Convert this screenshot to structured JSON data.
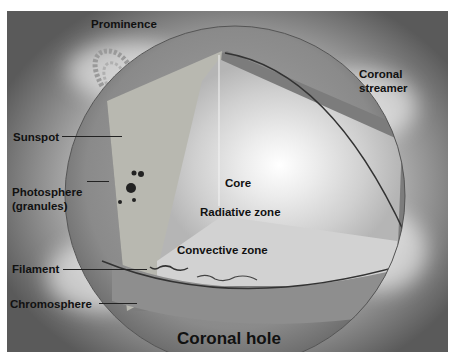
{
  "diagram": {
    "labels": {
      "prominence": "Prominence",
      "coronal_streamer_line1": "Coronal",
      "coronal_streamer_line2": "streamer",
      "sunspot": "Sunspot",
      "photosphere_line1": "Photosphere",
      "photosphere_line2": "(granules)",
      "core": "Core",
      "radiative_zone": "Radiative zone",
      "convective_zone": "Convective zone",
      "filament": "Filament",
      "chromosphere": "Chromosphere",
      "coronal_hole": "Coronal hole"
    },
    "colors": {
      "background_dark": "#5a5a5a",
      "glow": "#ffffff",
      "surface": "#8c8c8c",
      "convective": "#7a7a7a",
      "radiative": "#d9d9d9",
      "label_text": "#111111"
    }
  }
}
